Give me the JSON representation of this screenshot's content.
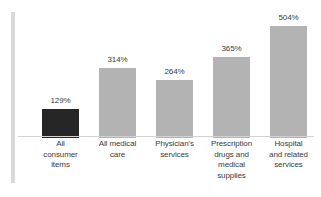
{
  "chart_data": {
    "type": "bar",
    "title": "",
    "subtitle": "",
    "xlabel": "",
    "ylabel": "",
    "ylim": [
      0,
      560
    ],
    "grid": false,
    "legend": "none",
    "categories": [
      "All consumer items",
      "All medical care",
      "Physician's services",
      "Prescription drugs and medical supplies",
      "Hospital and related services"
    ],
    "category_lines": [
      [
        "All",
        "consumer",
        "items"
      ],
      [
        "All medical",
        "care"
      ],
      [
        "Physician's",
        "services"
      ],
      [
        "Prescription",
        "drugs and",
        "medical",
        "supplies"
      ],
      [
        "Hospital",
        "and related",
        "services"
      ]
    ],
    "values": [
      129,
      314,
      264,
      365,
      504
    ],
    "value_labels": [
      "129%",
      "314%",
      "264%",
      "365%",
      "504%"
    ],
    "bar_colors": [
      "#262626",
      "#b3b3b3",
      "#b3b3b3",
      "#b3b3b3",
      "#b3b3b3"
    ]
  },
  "colors": {
    "background": "#ffffff",
    "bar_gray": "#b3b3b3",
    "bar_dark": "#262626",
    "accent_bar": "#d9d9d9",
    "axis_line": "#d2d2d2",
    "text": "#3b3b3b"
  }
}
